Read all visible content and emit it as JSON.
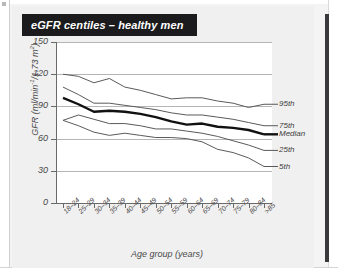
{
  "figure": {
    "title": "eGFR centiles – healthy men",
    "title_background": "#1b1b1d",
    "title_color": "#ffffff"
  },
  "page": {
    "background": "#f0f0f0",
    "edge_bar_color": "#3a3a3c"
  },
  "chart_data": {
    "type": "line",
    "title": "eGFR centiles – healthy men",
    "xlabel": "Age group (years)",
    "ylabel": "GFR (ml/min⁻¹/1.73 m²)",
    "ylim": [
      0,
      150
    ],
    "yticks": [
      0,
      30,
      60,
      90,
      120,
      150
    ],
    "grid": true,
    "grid_axis": "y",
    "legend_position": "right-inline",
    "categories": [
      "18–24",
      "25–29",
      "30–34",
      "35–39",
      "40–44",
      "45–49",
      "50–54",
      "55–59",
      "60–64",
      "65–69",
      "70–74",
      "75–79",
      "80–84",
      ">85"
    ],
    "series": [
      {
        "name": "95th",
        "label": "95th",
        "color": "#5a5a5a",
        "width": 1,
        "values": [
          120,
          118,
          112,
          116,
          108,
          105,
          101,
          97,
          98,
          98,
          95,
          93,
          89,
          92
        ]
      },
      {
        "name": "75th",
        "label": "75th",
        "color": "#5a5a5a",
        "width": 1,
        "values": [
          108,
          101,
          93,
          93,
          91,
          89,
          87,
          84,
          82,
          82,
          80,
          78,
          75,
          72
        ]
      },
      {
        "name": "Median",
        "label": "Median",
        "color": "#111111",
        "width": 2.4,
        "values": [
          98,
          92,
          85,
          86,
          85,
          83,
          80,
          76,
          73,
          74,
          71,
          70,
          68,
          64
        ]
      },
      {
        "name": "25th",
        "label": "25th",
        "color": "#5a5a5a",
        "width": 1,
        "values": [
          77,
          82,
          78,
          74,
          74,
          72,
          69,
          69,
          67,
          65,
          62,
          58,
          54,
          49
        ]
      },
      {
        "name": "5th",
        "label": "5th",
        "color": "#5a5a5a",
        "width": 1,
        "values": [
          77,
          72,
          66,
          63,
          65,
          63,
          61,
          61,
          60,
          57,
          50,
          47,
          42,
          34
        ]
      }
    ]
  }
}
